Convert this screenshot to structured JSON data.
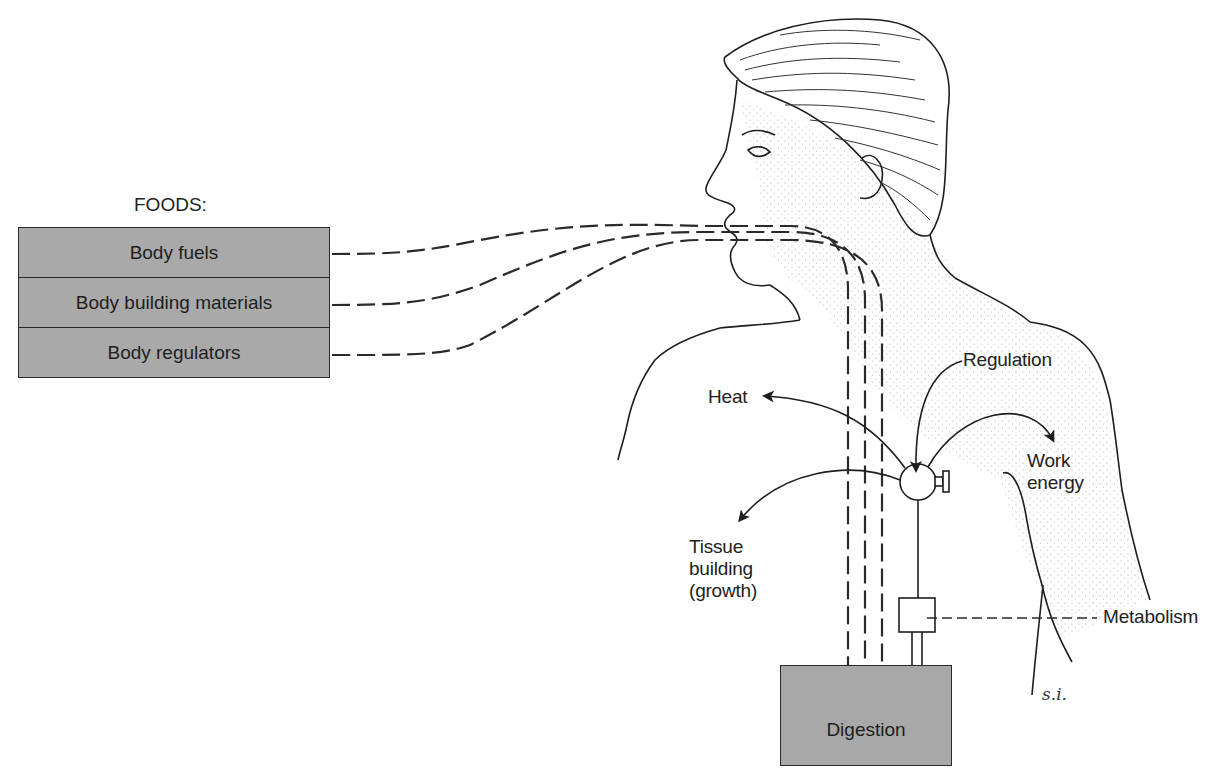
{
  "foods": {
    "title": "FOODS:",
    "items": [
      {
        "label": "Body fuels"
      },
      {
        "label": "Body building materials"
      },
      {
        "label": "Body regulators"
      }
    ]
  },
  "labels": {
    "heat": "Heat",
    "regulation": "Regulation",
    "work_energy_line1": "Work",
    "work_energy_line2": "energy",
    "tissue_line1": "Tissue",
    "tissue_line2": "building",
    "tissue_line3": "(growth)",
    "metabolism": "Metabolism",
    "digestion": "Digestion",
    "signature": "s.i."
  },
  "colors": {
    "box_fill": "#a9a9a9",
    "line": "#2a2a2a",
    "arrow_fill": "#555555",
    "background": "#ffffff"
  }
}
